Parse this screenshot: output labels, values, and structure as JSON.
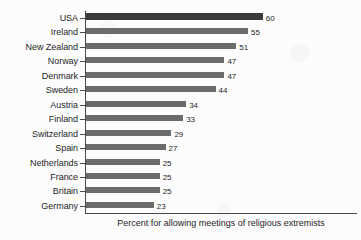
{
  "chart_data": {
    "type": "bar",
    "orientation": "horizontal",
    "title": "",
    "subtitle": "",
    "xlabel": "Percent for allowing meetings of religious extremists",
    "ylabel": "",
    "xlim": [
      0,
      62
    ],
    "grid": false,
    "legend": null,
    "highlight_category": "USA",
    "colors": {
      "bar": "#6b6b6b",
      "bar_highlight": "#3b3b3b",
      "axis": "#4a4a4a",
      "text": "#1f1f1f",
      "background": "#fdfdfd"
    },
    "categories": [
      "USA",
      "Ireland",
      "New Zealand",
      "Norway",
      "Denmark",
      "Sweden",
      "Austria",
      "Finland",
      "Switzerland",
      "Spain",
      "Netherlands",
      "France",
      "Britain",
      "Germany"
    ],
    "values": [
      60,
      55,
      51,
      47,
      47,
      44,
      34,
      33,
      29,
      27,
      25,
      25,
      25,
      23
    ],
    "value_labels": [
      "60",
      "55",
      "51",
      "47",
      "47",
      "44",
      "34",
      "33",
      "29",
      "27",
      "25",
      "25",
      "25",
      "23"
    ]
  },
  "caption": {
    "text": "Percent for allowing meetings of religious extremists"
  }
}
